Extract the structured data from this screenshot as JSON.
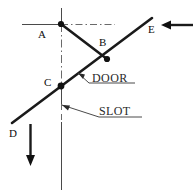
{
  "diagram": {
    "background_color": "#ffffff",
    "stroke_color": "#1a1a1a",
    "thin_stroke_color": "#4a4a4a",
    "label_color": "#2a2a2a",
    "points": [
      {
        "id": "A",
        "label": "A",
        "x": 61,
        "y": 24,
        "label_x": 38,
        "label_y": 38,
        "marker": true
      },
      {
        "id": "B",
        "label": "B",
        "x": 106,
        "y": 58,
        "label_x": 99,
        "label_y": 46,
        "marker": true
      },
      {
        "id": "C",
        "label": "C",
        "x": 61,
        "y": 86,
        "label_x": 44,
        "label_y": 86,
        "marker": true
      },
      {
        "id": "D",
        "label": "D",
        "x": 12,
        "y": 123,
        "label_x": 10,
        "label_y": 137,
        "marker": false
      },
      {
        "id": "E",
        "label": "E",
        "x": 152,
        "y": 18,
        "label_x": 150,
        "label_y": 33,
        "marker": false
      }
    ],
    "annotations": [
      {
        "id": "door",
        "label": "DOOR",
        "x": 92,
        "y": 84,
        "underline": true
      },
      {
        "id": "slot",
        "label": "SLOT",
        "x": 100,
        "y": 116,
        "underline": true
      }
    ],
    "lines": {
      "main_diagonal": {
        "from": "D",
        "to": "E",
        "style": "solid-thick"
      },
      "link_ab": {
        "from": "A",
        "to": "B",
        "style": "solid-thick"
      },
      "horizontal_axis": {
        "y": 24,
        "x_start": 22,
        "x_end": 115,
        "style": "solid-thin-with-dashdot"
      },
      "vertical_axis": {
        "x": 61,
        "y_start": 8,
        "y_end": 190,
        "style": "solid-thin-with-dashdot"
      }
    },
    "arrows": [
      {
        "id": "load-arrow-right",
        "direction": "left",
        "from_x": 193,
        "to_x": 161,
        "y": 25,
        "style": "thick"
      },
      {
        "id": "load-arrow-down",
        "direction": "down",
        "x": 30,
        "from_y": 124,
        "to_y": 165,
        "style": "thick"
      }
    ]
  }
}
